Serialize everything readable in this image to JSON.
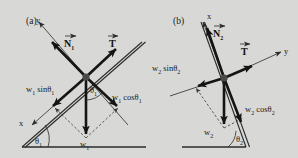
{
  "figure": {
    "background_color": "#d8d8d6",
    "ink_color": "#1a1a1a",
    "width": 298,
    "height": 158,
    "type": "free-body-diagram"
  },
  "panels": [
    {
      "id": "a",
      "label": "(a)",
      "axis_x_label": "x",
      "axis_y_label": "y",
      "normal_vector_label": "N",
      "normal_vector_sub": "1",
      "tension_vector_label": "T",
      "weight_label": "w",
      "weight_sub": "1",
      "sin_component_label": "w",
      "sin_component_sub": "1",
      "sin_component_rest": " sinθ",
      "sin_component_sub2": "1",
      "cos_component_label": "w",
      "cos_component_sub": "1",
      "cos_component_rest": " cosθ",
      "cos_component_sub2": "1",
      "angle_label": "θ",
      "angle_sub": "1"
    },
    {
      "id": "b",
      "label": "(b)",
      "axis_x_label": "x",
      "axis_y_label": "y",
      "normal_vector_label": "N",
      "normal_vector_sub": "2",
      "tension_vector_label": "T",
      "weight_label": "w",
      "weight_sub": "2",
      "sin_component_label": "w",
      "sin_component_sub": "2",
      "sin_component_rest": " sinθ",
      "sin_component_sub2": "2",
      "cos_component_label": "w",
      "cos_component_sub": "2",
      "cos_component_rest": " cosθ",
      "cos_component_sub2": "2",
      "angle_label": "θ",
      "angle_sub": "2"
    }
  ]
}
